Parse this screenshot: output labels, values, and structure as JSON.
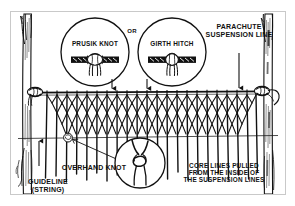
{
  "figure": {
    "title_alt": "Field-expedient net hammock rigged between two trees",
    "background_color": "#ffffff",
    "ink_color": "#111111",
    "frame_color": "#c9c9c9"
  },
  "callouts": {
    "prusik_knot": "PRUSIK KNOT",
    "or": "OR",
    "girth_hitch": "GIRTH HITCH",
    "parachute_suspension_line": "PARACHUTE\nSUSPENSION LINE",
    "overhand_knot": "OVERHAND KNOT",
    "core_lines": "CORE LINES PULLED\nFROM THE INSIDE OF\nTHE SUSPENSION LINES",
    "guideline": "GUIDELINE\n(STRING)"
  },
  "detail_circles": [
    {
      "name": "prusik-knot-detail",
      "label": "PRUSIK KNOT",
      "cx": 95,
      "cy": 52,
      "r": 34
    },
    {
      "name": "girth-hitch-detail",
      "label": "GIRTH HITCH",
      "cx": 172,
      "cy": 52,
      "r": 34
    },
    {
      "name": "overhand-knot-detail",
      "label": "OVERHAND KNOT",
      "cx": 140,
      "cy": 163,
      "r": 25
    }
  ],
  "structure": {
    "left_tree": "left-tree-trunk",
    "right_tree": "right-tree-trunk",
    "ridge_line": "horizontal-suspension-ridge-line",
    "guide_line": "horizontal-guideline-string",
    "mesh": "diamond-netting-mesh",
    "hanging_lines": "vertical-core-lines",
    "mesh_columns": 22,
    "mesh_rows": 4
  },
  "icons": {
    "arrow_down": "arrow-down-icon",
    "arrow_up": "arrow-up-icon",
    "leader_line": "leader-line-icon"
  }
}
